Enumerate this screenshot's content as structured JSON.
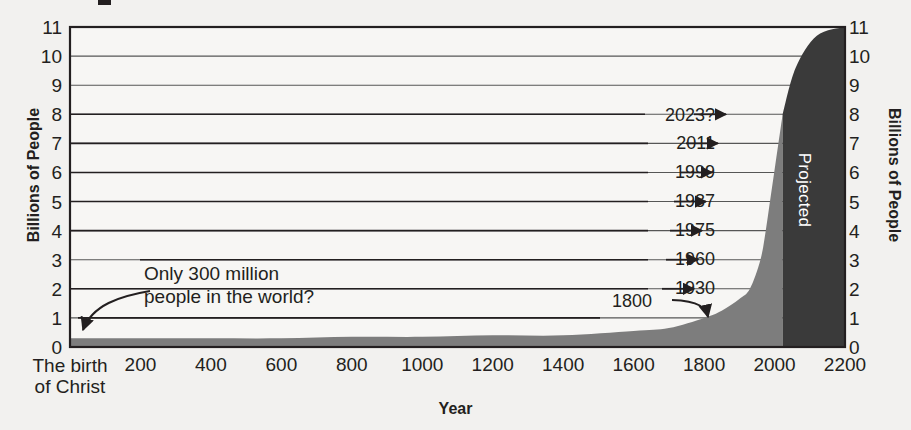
{
  "chart_data": {
    "type": "area",
    "title": "",
    "xlabel": "Year",
    "ylabel": "Billions of People",
    "ylabel_right": "Billions of People",
    "xlim": [
      0,
      2200
    ],
    "ylim": [
      0,
      11
    ],
    "grid": true,
    "x_ticks": [
      "200",
      "400",
      "600",
      "800",
      "1000",
      "1200",
      "1400",
      "1600",
      "1800",
      "2000",
      "2200"
    ],
    "x_tick_values": [
      200,
      400,
      600,
      800,
      1000,
      1200,
      1400,
      1600,
      1800,
      2000,
      2200
    ],
    "x_origin_label_line1": "The birth",
    "x_origin_label_line2": "of Christ",
    "y_ticks": [
      "0",
      "1",
      "2",
      "3",
      "4",
      "5",
      "6",
      "7",
      "8",
      "9",
      "10",
      "11"
    ],
    "y_tick_values": [
      0,
      1,
      2,
      3,
      4,
      5,
      6,
      7,
      8,
      9,
      10,
      11
    ],
    "series": [
      {
        "name": "World population (historical)",
        "color": "#7d7d7d",
        "x": [
          0,
          200,
          400,
          600,
          800,
          1000,
          1200,
          1400,
          1600,
          1700,
          1800,
          1850,
          1900,
          1930,
          1960,
          1975,
          1987,
          1999,
          2011,
          2023
        ],
        "values": [
          0.3,
          0.3,
          0.3,
          0.3,
          0.35,
          0.35,
          0.4,
          0.4,
          0.55,
          0.65,
          1.0,
          1.25,
          1.65,
          2.0,
          3.0,
          4.0,
          5.0,
          6.0,
          7.0,
          8.0
        ]
      },
      {
        "name": "Projected",
        "color": "#3a3a3a",
        "x": [
          2023,
          2100,
          2200
        ],
        "values": [
          8.0,
          10.4,
          11.0
        ]
      }
    ],
    "annotations": [
      {
        "id": "note-300m",
        "text_line1": "Only 300 million",
        "text_line2": "people in the world?",
        "points_to_year": 0,
        "points_to_value": 0.3
      },
      {
        "id": "callout-1800",
        "label": "1800",
        "year": 1800,
        "value": 1.0
      },
      {
        "id": "callout-1930",
        "label": "1930",
        "year": 1930,
        "value": 2.0
      },
      {
        "id": "callout-1960",
        "label": "1960",
        "year": 1960,
        "value": 3.0
      },
      {
        "id": "callout-1975",
        "label": "1975",
        "year": 1975,
        "value": 4.0
      },
      {
        "id": "callout-1987",
        "label": "1987",
        "year": 1987,
        "value": 5.0
      },
      {
        "id": "callout-1999",
        "label": "1999",
        "year": 1999,
        "value": 6.0
      },
      {
        "id": "callout-2011",
        "label": "2011",
        "year": 2011,
        "value": 7.0
      },
      {
        "id": "callout-2023",
        "label": "2023?",
        "year": 2023,
        "value": 8.0
      },
      {
        "id": "projected-region",
        "label": "Projected",
        "from_year": 2023,
        "to_year": 2200
      }
    ]
  },
  "axes": {
    "y_title_left": "Billions of People",
    "y_title_right": "Billions of People",
    "x_title": "Year"
  },
  "colors": {
    "background": "#f2f1ef",
    "plot_background": "#f7f6f4",
    "historical_fill": "#7d7d7d",
    "projected_fill": "#3a3a3a",
    "gridline": "#565656",
    "axis": "#231f20",
    "text": "#231f20",
    "projected_text": "#ffffff"
  }
}
